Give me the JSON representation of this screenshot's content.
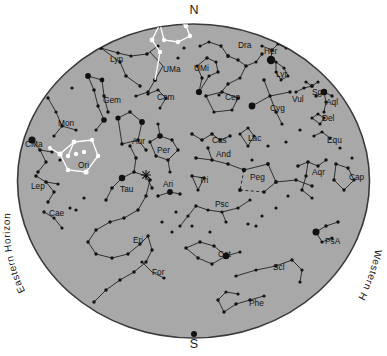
{
  "chart_data": {
    "type": "scatter",
    "projection": "all-sky stereographic horizon map",
    "grid": false,
    "legend_position": "none",
    "xlabel": "",
    "ylabel": "",
    "colors": {
      "sky_fill": "#a8a8a8",
      "sky_edge": "#3a3a3a",
      "page_background": "#ffffff",
      "star_color": "#111111",
      "constellation_line": "#1a1a1a",
      "highlight_star": "#ffffff",
      "highlight_line": "#ffffff",
      "label_color": "#111111"
    },
    "cardinals": [
      {
        "label": "N",
        "x": 194,
        "y": 14
      },
      {
        "label": "S",
        "x": 194,
        "y": 348
      }
    ],
    "horizon_labels": [
      {
        "label": "Eastern Horizon",
        "side": "left"
      },
      {
        "label": "Western Horizon",
        "side": "right"
      }
    ],
    "constellations": [
      {
        "abbr": "Lyn",
        "name": "Lynx",
        "x": 110,
        "y": 62
      },
      {
        "abbr": "UMa",
        "name": "Ursa Major",
        "x": 163,
        "y": 72,
        "highlight": true
      },
      {
        "abbr": "UMi",
        "name": "Ursa Minor",
        "x": 194,
        "y": 71
      },
      {
        "abbr": "Dra",
        "name": "Draco",
        "x": 238,
        "y": 48
      },
      {
        "abbr": "Her",
        "name": "Hercules",
        "x": 264,
        "y": 54
      },
      {
        "abbr": "Lyr",
        "name": "Lyra",
        "x": 276,
        "y": 77
      },
      {
        "abbr": "Cep",
        "name": "Cepheus",
        "x": 225,
        "y": 100
      },
      {
        "abbr": "Cyg",
        "name": "Cygnus",
        "x": 270,
        "y": 111
      },
      {
        "abbr": "Vul",
        "name": "Vulpecula",
        "x": 292,
        "y": 102
      },
      {
        "abbr": "Sge",
        "name": "Sagitta",
        "x": 312,
        "y": 95
      },
      {
        "abbr": "Aql",
        "name": "Aquila",
        "x": 326,
        "y": 105
      },
      {
        "abbr": "Del",
        "name": "Delphinus",
        "x": 322,
        "y": 121
      },
      {
        "abbr": "Equ",
        "name": "Equuleus",
        "x": 327,
        "y": 143
      },
      {
        "abbr": "Cam",
        "name": "Camelopardalis",
        "x": 157,
        "y": 100
      },
      {
        "abbr": "Gem",
        "name": "Gemini",
        "x": 103,
        "y": 103
      },
      {
        "abbr": "Mon",
        "name": "Monoceros",
        "x": 58,
        "y": 126
      },
      {
        "abbr": "CMa",
        "name": "Canis Major",
        "x": 25,
        "y": 147
      },
      {
        "abbr": "Ori",
        "name": "Orion",
        "x": 78,
        "y": 168,
        "highlight": true
      },
      {
        "abbr": "Aur",
        "name": "Auriga",
        "x": 132,
        "y": 144
      },
      {
        "abbr": "Per",
        "name": "Perseus",
        "x": 157,
        "y": 153
      },
      {
        "abbr": "Cas",
        "name": "Cassiopeia",
        "x": 212,
        "y": 143
      },
      {
        "abbr": "And",
        "name": "Andromeda",
        "x": 216,
        "y": 157
      },
      {
        "abbr": "Lac",
        "name": "Lacerta",
        "x": 248,
        "y": 141
      },
      {
        "abbr": "Peg",
        "name": "Pegasus",
        "x": 250,
        "y": 180
      },
      {
        "abbr": "Tri",
        "name": "Triangulum",
        "x": 199,
        "y": 183
      },
      {
        "abbr": "Ari",
        "name": "Aries",
        "x": 163,
        "y": 187
      },
      {
        "abbr": "Tau",
        "name": "Taurus",
        "x": 120,
        "y": 192
      },
      {
        "abbr": "Psc",
        "name": "Pisces",
        "x": 215,
        "y": 207
      },
      {
        "abbr": "Aqr",
        "name": "Aquarius",
        "x": 312,
        "y": 175
      },
      {
        "abbr": "Cap",
        "name": "Capricornus",
        "x": 349,
        "y": 180
      },
      {
        "abbr": "PsA",
        "name": "Piscis Austrinus",
        "x": 325,
        "y": 244
      },
      {
        "abbr": "Lep",
        "name": "Lepus",
        "x": 31,
        "y": 189
      },
      {
        "abbr": "Cae",
        "name": "Caelum",
        "x": 49,
        "y": 216
      },
      {
        "abbr": "Eri",
        "name": "Eridanus",
        "x": 133,
        "y": 243
      },
      {
        "abbr": "For",
        "name": "Fornax",
        "x": 152,
        "y": 275
      },
      {
        "abbr": "Cet",
        "name": "Cetus",
        "x": 218,
        "y": 257
      },
      {
        "abbr": "Scl",
        "name": "Sculptor",
        "x": 273,
        "y": 270
      },
      {
        "abbr": "Phe",
        "name": "Phoenix",
        "x": 249,
        "y": 306
      }
    ],
    "special_objects": [
      {
        "name": "Pleiades",
        "symbol": "star-cluster",
        "x": 146,
        "y": 175
      }
    ],
    "star_magnitude_scale": {
      "brightest_radius_px": 4.2,
      "faintest_radius_px": 1.4
    },
    "star_count_visible": 330,
    "highlighted_asterisms": [
      {
        "name": "Big Dipper",
        "parent": "Ursa Major",
        "star_count": 7
      },
      {
        "name": "Orion",
        "parent": "Orion",
        "star_count": 7
      }
    ]
  }
}
